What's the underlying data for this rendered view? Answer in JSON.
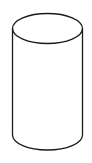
{
  "figure": {
    "shape": "cylinder",
    "style": "line-drawing",
    "colors": {
      "background": "#ffffff",
      "stroke": "#1a1a1a"
    }
  }
}
